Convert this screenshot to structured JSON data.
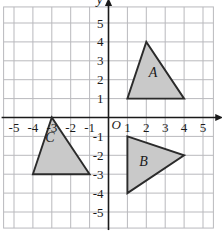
{
  "chart_data": {
    "type": "scatter",
    "title": "",
    "xlabel": "x",
    "ylabel": "y",
    "xlim": [
      -5.8,
      5.8
    ],
    "ylim": [
      -5.8,
      5.8
    ],
    "grid": true,
    "legend": "none",
    "origin_label": "O",
    "x_ticks": [
      "-5",
      "-4",
      "-3",
      "-2",
      "-1",
      "1",
      "2",
      "3",
      "4",
      "5"
    ],
    "y_ticks": [
      "5",
      "4",
      "3",
      "2",
      "1",
      "-1",
      "-2",
      "-3",
      "-4",
      "-5"
    ],
    "x_tick_values": [
      -5,
      -4,
      -3,
      -2,
      -1,
      1,
      2,
      3,
      4,
      5
    ],
    "y_tick_values": [
      5,
      4,
      3,
      2,
      1,
      -1,
      -2,
      -3,
      -4,
      -5
    ],
    "annotations": [
      {
        "name": "A",
        "label": "A",
        "label_x": 2.35,
        "label_y": 2.15,
        "vertices": [
          [
            1,
            1
          ],
          [
            2,
            4
          ],
          [
            4,
            1
          ]
        ]
      },
      {
        "name": "B",
        "label": "B",
        "label_x": 1.85,
        "label_y": -2.55,
        "vertices": [
          [
            1,
            -1
          ],
          [
            4,
            -2
          ],
          [
            1,
            -4
          ]
        ]
      },
      {
        "name": "C",
        "label": "C",
        "label_x": -3.1,
        "label_y": -1.3,
        "vertices": [
          [
            -4,
            -3
          ],
          [
            -3,
            0
          ],
          [
            -1,
            -3
          ]
        ]
      }
    ]
  },
  "style": {
    "grid_line_color": "#b9b9bd",
    "axis_color": "#1a1a1a",
    "shape_fill": "#c9c9c9",
    "shape_stroke": "#2b2b2b",
    "background": "#ffffff"
  }
}
